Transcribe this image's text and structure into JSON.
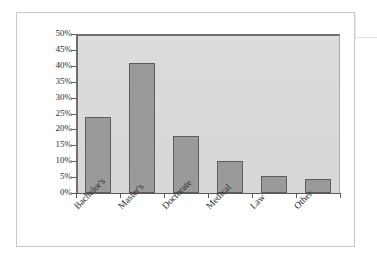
{
  "chart_data": {
    "type": "bar",
    "title": "",
    "subtitle": "",
    "xlabel": "",
    "ylabel": "",
    "categories": [
      "Bachelor's",
      "Master's",
      "Doctorate",
      "Medical",
      "Law",
      "Other"
    ],
    "values": [
      24,
      41,
      18,
      10,
      5.5,
      4.5
    ],
    "ylim": [
      0,
      50
    ],
    "ytick_labels": [
      "50%",
      "45%",
      "40%",
      "35%",
      "30%",
      "25%",
      "20%",
      "15%",
      "10%",
      "5%",
      "0%"
    ],
    "ytick_values": [
      50,
      45,
      40,
      35,
      30,
      25,
      20,
      15,
      10,
      5,
      0
    ],
    "grid": false,
    "legend": "none",
    "series": [
      {
        "name": "Share",
        "values": [
          24,
          41,
          18,
          10,
          5.5,
          4.5
        ]
      }
    ],
    "colors": {
      "bar_fill": "#9a9a9a",
      "bar_border": "#5d5d5d",
      "plot_background": "#d9d9d9",
      "axis": "#5a5a5a",
      "frame_border": "#c9c9c9",
      "text": "#2b2b2b"
    }
  }
}
